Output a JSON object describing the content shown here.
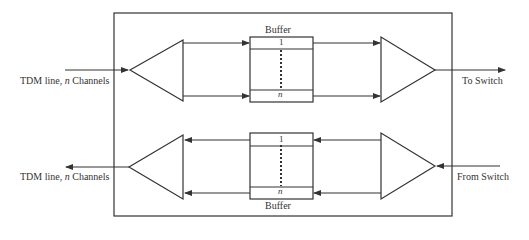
{
  "diagram": {
    "top_buffer_label": "Buffer",
    "bottom_buffer_label": "Buffer",
    "buffer_slot_first": "1",
    "buffer_slot_last": "n",
    "left_top_label_prefix": "TDM line, ",
    "left_top_label_var": "n",
    "left_top_label_suffix": " Channels",
    "left_bottom_label_prefix": "TDM line, ",
    "left_bottom_label_var": "n",
    "left_bottom_label_suffix": " Channels",
    "right_top_label": "To Switch",
    "right_bottom_label": "From Switch"
  },
  "colors": {
    "line": "#333333",
    "text": "#333333",
    "background": "#ffffff"
  }
}
